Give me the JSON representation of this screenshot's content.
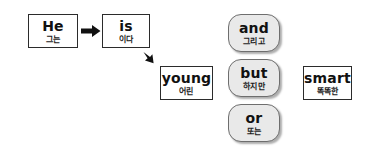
{
  "diagram": {
    "background_color": "#ffffff",
    "card_fill": "#ffffff",
    "card_border": "#2b2b2b",
    "pill_fill": "#e9e9e9",
    "pill_border": "#6e6e6e",
    "arrow_color": "#111111"
  },
  "subject_card": {
    "english": "He",
    "korean": "그는"
  },
  "verb_card": {
    "english": "is",
    "korean": "이다"
  },
  "adjective_card": {
    "english": "young",
    "korean": "어린"
  },
  "complement_card": {
    "english": "smart",
    "korean": "똑똑한"
  },
  "conjunctions": [
    {
      "english": "and",
      "korean": "그리고"
    },
    {
      "english": "but",
      "korean": "하지만"
    },
    {
      "english": "or",
      "korean": "또는"
    }
  ],
  "arrows": {
    "subject_to_verb": "arrow-right-icon",
    "verb_to_adjective": "arrow-down-right-icon"
  }
}
